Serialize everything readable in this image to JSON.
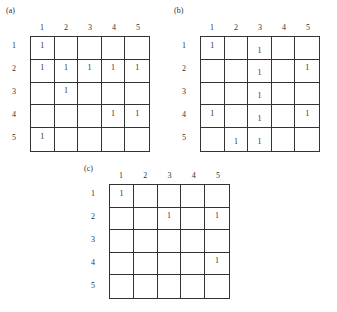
{
  "panels": [
    {
      "label": "(a)",
      "col_labels": [
        "1",
        "2",
        "3",
        "4",
        "5"
      ],
      "row_labels": [
        "1",
        "2",
        "3",
        "4",
        "5"
      ],
      "cells": [
        [
          "1",
          "",
          "",
          "",
          ""
        ],
        [
          "1",
          "1",
          "1",
          "1",
          "1"
        ],
        [
          "",
          "1",
          "",
          "",
          ""
        ],
        [
          "",
          "",
          "",
          "1",
          "1"
        ],
        [
          "1",
          "",
          "",
          "",
          ""
        ]
      ]
    },
    {
      "label": "(b)",
      "col_labels": [
        "1",
        "2",
        "3",
        "4",
        "5"
      ],
      "row_labels": [
        "1",
        "2",
        "3",
        "4",
        "5"
      ],
      "cells": [
        [
          "1",
          "",
          "1",
          "",
          ""
        ],
        [
          "",
          "",
          "1",
          "",
          "1"
        ],
        [
          "",
          "",
          "1",
          "",
          ""
        ],
        [
          "1",
          "",
          "1",
          "",
          "1"
        ],
        [
          "",
          "1",
          "1",
          "",
          ""
        ]
      ]
    },
    {
      "label": "(c)",
      "col_labels": [
        "1",
        "2",
        "3",
        "4",
        "5"
      ],
      "row_labels": [
        "1",
        "2",
        "3",
        "4",
        "5"
      ],
      "cells": [
        [
          "1",
          "",
          "",
          "",
          ""
        ],
        [
          "",
          "",
          "1",
          "",
          "1"
        ],
        [
          "",
          "",
          "",
          "",
          ""
        ],
        [
          "",
          "",
          "",
          "",
          "1"
        ],
        [
          "",
          "",
          "",
          "",
          ""
        ]
      ]
    }
  ]
}
